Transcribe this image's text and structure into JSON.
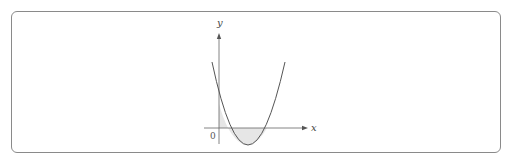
{
  "diagram": {
    "type": "function-graph",
    "axes": {
      "x_label": "x",
      "y_label": "y",
      "origin_label": "0"
    },
    "curve": {
      "kind": "parabola",
      "opens": "up",
      "crosses_y_axis": "positive",
      "roots": "two positive roots",
      "stroke_color": "#555555"
    },
    "shaded_regions": [
      {
        "name": "region-between-y-axis-and-first-root",
        "position": "above x-axis"
      },
      {
        "name": "region-between-roots",
        "position": "below x-axis"
      }
    ],
    "colors": {
      "frame": "#8a8a8a",
      "axes": "#666666",
      "shade": "#e6e6e6"
    }
  }
}
